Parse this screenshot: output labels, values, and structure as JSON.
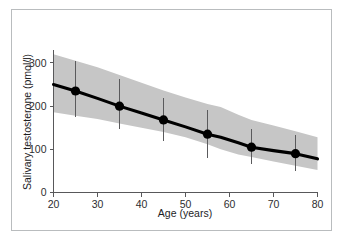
{
  "chart_data": {
    "type": "line",
    "title": "",
    "subtitle": "",
    "xlabel": "Age (years)",
    "ylabel": "Salivary testosterone (pmol/l)",
    "xlim": [
      20,
      80
    ],
    "ylim": [
      0,
      330
    ],
    "xticks": [
      20,
      30,
      40,
      50,
      60,
      70,
      80
    ],
    "xtick_labels": [
      "20",
      "30",
      "40",
      "50",
      "60",
      "70",
      "80"
    ],
    "yticks": [
      0,
      100,
      200,
      300
    ],
    "ytick_labels": [
      "0",
      "100",
      "200",
      "300"
    ],
    "grid": false,
    "legend": "none",
    "annotations": [],
    "series": [
      {
        "name": "Mean salivary testosterone",
        "marker": "filled-circle",
        "x": [
          25,
          35,
          45,
          55,
          65,
          75
        ],
        "values": [
          235,
          200,
          168,
          135,
          105,
          90
        ],
        "error_low": [
          175,
          148,
          120,
          80,
          65,
          50
        ],
        "error_high": [
          305,
          262,
          218,
          190,
          148,
          133
        ]
      }
    ],
    "band": {
      "name": "Confidence interval",
      "color": "#c6c6c6",
      "x": [
        20,
        25,
        30,
        35,
        40,
        45,
        50,
        55,
        58,
        62,
        65,
        70,
        75,
        80
      ],
      "lower": [
        186,
        178,
        170,
        160,
        150,
        140,
        128,
        112,
        100,
        88,
        82,
        72,
        62,
        52
      ],
      "upper": [
        320,
        305,
        290,
        272,
        254,
        236,
        220,
        205,
        198,
        180,
        168,
        155,
        142,
        128
      ],
      "line": [
        250,
        235,
        218,
        200,
        184,
        168,
        152,
        135,
        128,
        115,
        105,
        97,
        90,
        78
      ]
    }
  },
  "figure": {
    "frame_color": "#b9bcbe",
    "background": "#ffffff",
    "axis_color": "#58585a",
    "marker_color": "#000000",
    "line_color": "#000000",
    "band_color": "#c6c6c6"
  }
}
